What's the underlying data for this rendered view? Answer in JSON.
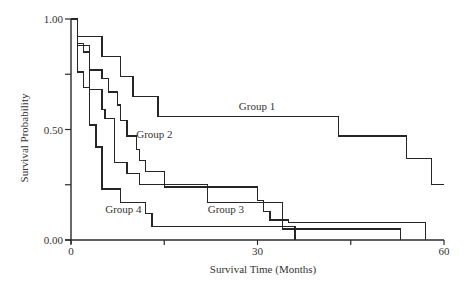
{
  "chart_data": {
    "type": "line",
    "subtype": "kaplan-meier-step",
    "title": "",
    "xlabel": "Survival Time (Months)",
    "ylabel": "Survival Probability",
    "xlim": [
      0,
      60
    ],
    "ylim": [
      0,
      1
    ],
    "x_ticks": [
      0,
      15,
      30,
      45,
      60
    ],
    "x_tick_labels": [
      "0",
      "",
      "30",
      "",
      "60"
    ],
    "y_ticks": [
      0,
      0.25,
      0.5,
      0.75,
      1.0
    ],
    "y_tick_labels": [
      "0.00",
      "",
      "0.50",
      "",
      "1.00"
    ],
    "grid": false,
    "legend": "inline labels",
    "series": [
      {
        "name": "Group 1",
        "label_pos": {
          "x": 27,
          "y": 0.59
        },
        "steps": [
          [
            0,
            1.0
          ],
          [
            1,
            0.92
          ],
          [
            5,
            0.83
          ],
          [
            8,
            0.74
          ],
          [
            10,
            0.65
          ],
          [
            14,
            0.56
          ],
          [
            43,
            0.47
          ],
          [
            54,
            0.37
          ],
          [
            58,
            0.25
          ]
        ],
        "end_x": 60
      },
      {
        "name": "Group 2",
        "label_pos": {
          "x": 10.5,
          "y": 0.46
        },
        "steps": [
          [
            0,
            1.0
          ],
          [
            1,
            0.89
          ],
          [
            2,
            0.85
          ],
          [
            3,
            0.77
          ],
          [
            5,
            0.73
          ],
          [
            6,
            0.67
          ],
          [
            7.5,
            0.61
          ],
          [
            8,
            0.54
          ],
          [
            9,
            0.47
          ],
          [
            10.5,
            0.41
          ],
          [
            11,
            0.36
          ],
          [
            12,
            0.31
          ],
          [
            15,
            0.24
          ],
          [
            30,
            0.18
          ],
          [
            31,
            0.13
          ],
          [
            32,
            0.09
          ],
          [
            34,
            0.05
          ],
          [
            53,
            0.0
          ]
        ],
        "end_x": 53
      },
      {
        "name": "Group 3",
        "label_pos": {
          "x": 22,
          "y": 0.12
        },
        "steps": [
          [
            0,
            1.0
          ],
          [
            1,
            0.88
          ],
          [
            3,
            0.68
          ],
          [
            5,
            0.59
          ],
          [
            5.5,
            0.55
          ],
          [
            7,
            0.35
          ],
          [
            9,
            0.3
          ],
          [
            11,
            0.25
          ],
          [
            22,
            0.17
          ],
          [
            34,
            0.09
          ],
          [
            35,
            0.08
          ],
          [
            57,
            0.0
          ]
        ],
        "end_x": 57
      },
      {
        "name": "Group 4",
        "label_pos": {
          "x": 5.5,
          "y": 0.12
        },
        "steps": [
          [
            0,
            1.0
          ],
          [
            1,
            0.76
          ],
          [
            2,
            0.69
          ],
          [
            3,
            0.52
          ],
          [
            4,
            0.42
          ],
          [
            5,
            0.23
          ],
          [
            8,
            0.17
          ],
          [
            12,
            0.12
          ],
          [
            13,
            0.06
          ],
          [
            36,
            0.0
          ]
        ],
        "end_x": 36
      }
    ]
  },
  "layout": {
    "origin_px": {
      "x": 71,
      "y": 240
    },
    "x_max_px": 444,
    "y_max_px": 19
  },
  "labels": {
    "ylabel": "Survival Probability",
    "xlabel": "Survival Time (Months)"
  }
}
